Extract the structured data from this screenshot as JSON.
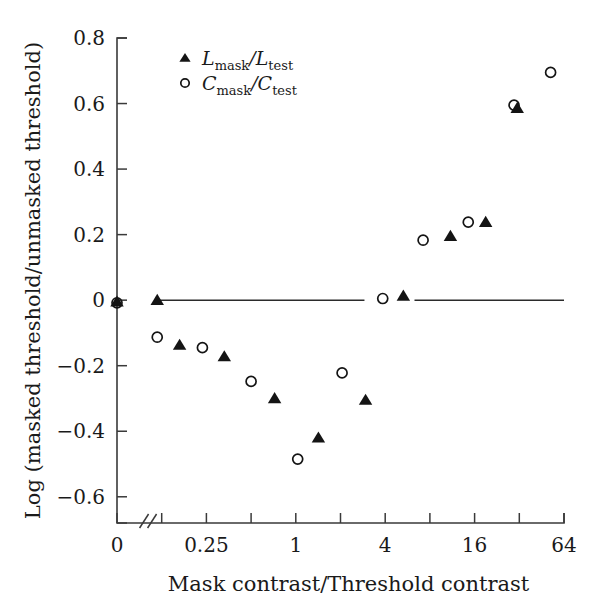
{
  "figure": {
    "background": "#ffffff",
    "foreground": "#1a1a1a"
  },
  "axes": {
    "x_title": "Mask contrast/Threshold contrast",
    "y_title": "Log (masked threshold/unmasked threshold)",
    "x_tick_labels": [
      "0",
      "0.25",
      "1",
      "4",
      "16",
      "64"
    ],
    "y_tick_labels": [
      "0.8",
      "0.6",
      "0.4",
      "0.2",
      "0",
      "−0.2",
      "−0.4",
      "−0.6"
    ],
    "axis_break_symbol": "//",
    "has_axis_break": true
  },
  "legend": {
    "entries": [
      {
        "marker": "filled-triangle",
        "symbol": "L",
        "sub1": "mask",
        "slash": "/",
        "symbol2": "L",
        "sub2": "test",
        "text": "Lmask/Ltest"
      },
      {
        "marker": "open-circle",
        "symbol": "C",
        "sub1": "mask",
        "slash": "/",
        "symbol2": "C",
        "sub2": "test",
        "text": "Cmask/Ctest"
      }
    ]
  },
  "chart_data": {
    "type": "scatter",
    "title": "",
    "xlabel": "Mask contrast/Threshold contrast",
    "ylabel": "Log (masked threshold/unmasked threshold)",
    "x_scale": "log2-with-break-at-zero",
    "x_tick_values": [
      0,
      0.25,
      1,
      4,
      16,
      64
    ],
    "x_minor_tick_count_between": 1,
    "ylim": [
      -0.68,
      0.8
    ],
    "yticks": [
      0.8,
      0.6,
      0.4,
      0.2,
      0,
      -0.2,
      -0.4,
      -0.6
    ],
    "grid": false,
    "legend_position": "top-left-inside",
    "reference_lines": [
      {
        "value": 0,
        "orientation": "horizontal",
        "segments": [
          [
            0.105,
            2.9
          ],
          [
            6.3,
            90
          ]
        ]
      }
    ],
    "series": [
      {
        "name": "Lmask/Ltest",
        "marker": "filled-triangle",
        "color": "#141414",
        "points": [
          {
            "x": 0,
            "y": -0.005
          },
          {
            "x": 0.058,
            "y": 0.0
          },
          {
            "x": 0.165,
            "y": -0.137
          },
          {
            "x": 0.33,
            "y": -0.172
          },
          {
            "x": 0.72,
            "y": -0.3
          },
          {
            "x": 1.42,
            "y": -0.42
          },
          {
            "x": 2.95,
            "y": -0.305
          },
          {
            "x": 5.3,
            "y": 0.013
          },
          {
            "x": 11.0,
            "y": 0.195
          },
          {
            "x": 19.0,
            "y": 0.238
          },
          {
            "x": 31.0,
            "y": 0.586
          }
        ]
      },
      {
        "name": "Cmask/Ctest",
        "marker": "open-circle",
        "color": "#141414",
        "points": [
          {
            "x": 0,
            "y": -0.008
          },
          {
            "x": 0.105,
            "y": -0.113
          },
          {
            "x": 0.235,
            "y": -0.145
          },
          {
            "x": 0.5,
            "y": -0.248
          },
          {
            "x": 1.03,
            "y": -0.485
          },
          {
            "x": 2.05,
            "y": -0.222
          },
          {
            "x": 3.85,
            "y": 0.005
          },
          {
            "x": 7.2,
            "y": 0.183
          },
          {
            "x": 14.5,
            "y": 0.238
          },
          {
            "x": 29.5,
            "y": 0.595
          },
          {
            "x": 52.0,
            "y": 0.695
          }
        ]
      }
    ]
  }
}
